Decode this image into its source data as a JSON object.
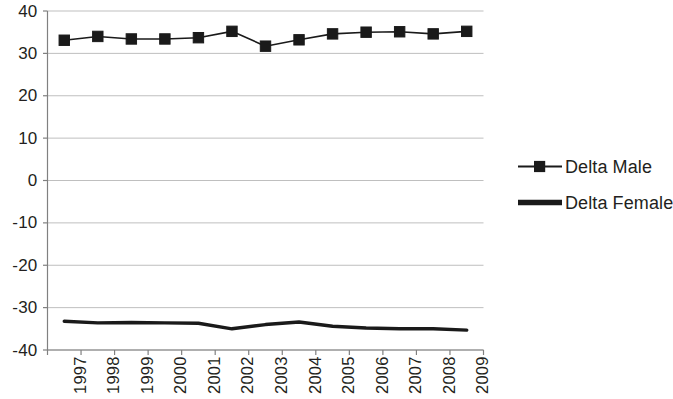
{
  "chart_data": {
    "type": "line",
    "title": "",
    "subtitle": "",
    "xlabel": "",
    "ylabel": "",
    "categories": [
      "1997",
      "1998",
      "1999",
      "2000",
      "2001",
      "2002",
      "2003",
      "2004",
      "2005",
      "2006",
      "2007",
      "2008",
      "2009"
    ],
    "series": [
      {
        "name": "Delta Male",
        "marker": "square",
        "color": "#1a1a1a",
        "values": [
          33.1,
          34.0,
          33.4,
          33.4,
          33.7,
          35.2,
          31.7,
          33.2,
          34.6,
          35.0,
          35.1,
          34.6,
          35.2
        ]
      },
      {
        "name": "Delta Female",
        "marker": "none",
        "color": "#1a1a1a",
        "values": [
          -33.2,
          -33.6,
          -33.5,
          -33.6,
          -33.7,
          -35.0,
          -34.0,
          -33.4,
          -34.4,
          -34.8,
          -35.0,
          -35.0,
          -35.3
        ]
      }
    ],
    "ylim": [
      -40,
      40
    ],
    "ytick_labels": [
      "40",
      "30",
      "20",
      "10",
      "0",
      "-10",
      "-20",
      "-30",
      "-40"
    ],
    "ytick_values": [
      40,
      30,
      20,
      10,
      0,
      -10,
      -20,
      -30,
      -40
    ],
    "grid": true,
    "grid_color": "#bfbfbf",
    "axis_color": "#808080",
    "legend_position": "right",
    "legend_entries": [
      "Delta Male",
      "Delta Female"
    ]
  },
  "legend": {
    "items": [
      {
        "label": "Delta Male",
        "marker": "square-line-marker"
      },
      {
        "label": "Delta Female",
        "marker": "thick-line-marker"
      }
    ]
  }
}
